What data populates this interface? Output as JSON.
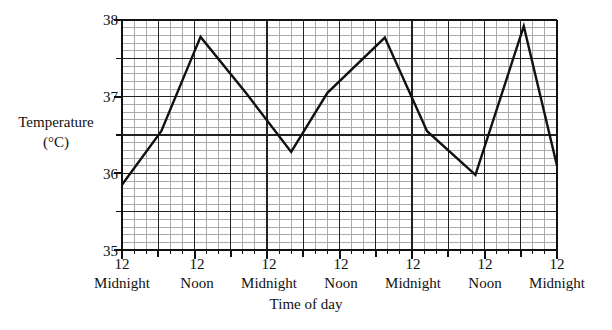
{
  "chart_data": {
    "type": "line",
    "title": "",
    "xlabel": "Time of day",
    "ylabel": "Temperature",
    "ylabel_unit": "(°C)",
    "ylim": [
      35,
      38
    ],
    "yticks": [
      35,
      36,
      37,
      38
    ],
    "ytick_labels": [
      "35",
      "36",
      "37",
      "38"
    ],
    "y_minor_step": 0.5,
    "grid": true,
    "grid_minor": true,
    "legend": "none",
    "x": [
      0,
      12,
      24,
      36,
      48,
      60,
      72
    ],
    "xtick_labels": [
      "12",
      "12",
      "12",
      "12",
      "12",
      "12",
      "12"
    ],
    "xtick_periods": [
      "Midnight",
      "Noon",
      "Midnight",
      "Noon",
      "Midnight",
      "Noon",
      "Midnight"
    ],
    "series": [
      {
        "name": "Body temperature",
        "x": [
          0,
          6.5,
          13.0,
          20.5,
          28.0,
          34.0,
          43.5,
          50.5,
          58.5,
          66.5,
          72.0
        ],
        "values": [
          35.85,
          36.55,
          37.78,
          37.05,
          36.28,
          37.05,
          37.77,
          36.55,
          35.98,
          37.92,
          36.1
        ]
      }
    ]
  },
  "line_color": "#111111",
  "grid_color_major": "#222222",
  "grid_color_minor": "#aaaaaa"
}
